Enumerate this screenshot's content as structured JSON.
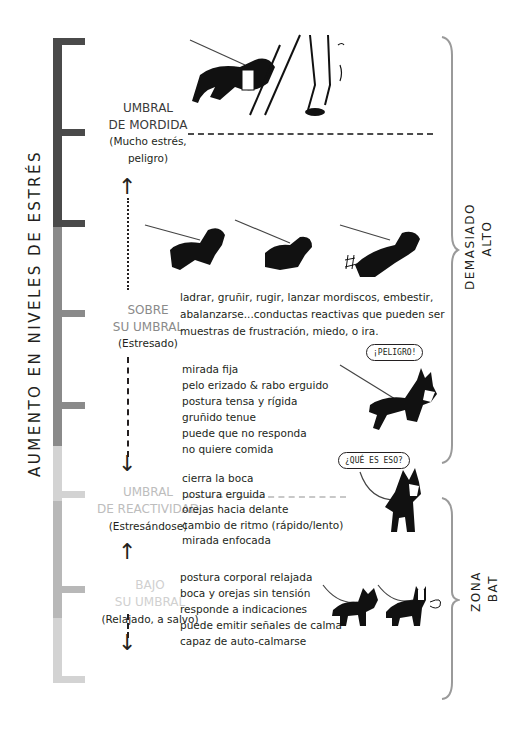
{
  "axis_label": "AUMENTO EN  NIVELES DE ESTRÉS",
  "colors": {
    "bar_dark": "#4a4a4a",
    "bar_mid": "#8a8a8a",
    "bar_light": "#d3d3d3",
    "bar_mid_light": "#b8b8b8",
    "zone_title_dark": "#3a3a3a",
    "zone_title_mid": "#8a8a8a",
    "zone_title_light": "#bdbdbd",
    "brace": "#9a9a9a"
  },
  "zones": [
    {
      "title_line1": "UMBRAL",
      "title_line2": "DE MORDIDA",
      "subtitle_line1": "(Mucho estrés,",
      "subtitle_line2": "peligro)"
    },
    {
      "title_line1": "SOBRE",
      "title_line2": "SU UMBRAL",
      "subtitle": "(Estresado)",
      "description": [
        "ladrar, gruñir, rugir, lanzar mordiscos, embestir,",
        "abalanzarse...conductas reactivas que pueden ser",
        "muestras de frustración, miedo, o ira."
      ],
      "signs": [
        "mirada fija",
        "pelo erizado & rabo erguido",
        "postura tensa y rígida",
        "gruñido tenue",
        "puede que no responda",
        "no quiere comida"
      ],
      "bubble": "¡PELIGRO!"
    },
    {
      "title_line1": "UMBRAL",
      "title_line2": "DE REACTIVIDAD",
      "subtitle": "(Estresándose)",
      "signs": [
        "cierra la boca",
        "postura erguida",
        "orejas hacia delante",
        "cambio de ritmo (rápido/lento)",
        "mirada enfocada"
      ],
      "bubble": "¿QUÉ ES ESO?"
    },
    {
      "title_line1": "BAJO",
      "title_line2": "SU UMBRAL",
      "subtitle": "(Relajado, a salvo)",
      "signs": [
        "postura corporal relajada",
        "boca y orejas sin tensión",
        "responde a indicaciones",
        "puede emitir señales de calma",
        "capaz de auto-calmarse"
      ]
    }
  ],
  "right_brackets": [
    {
      "line1": "DEMASIADO",
      "line2": "ALTO"
    },
    {
      "line1": "ZONA",
      "line2": "BAT"
    }
  ]
}
